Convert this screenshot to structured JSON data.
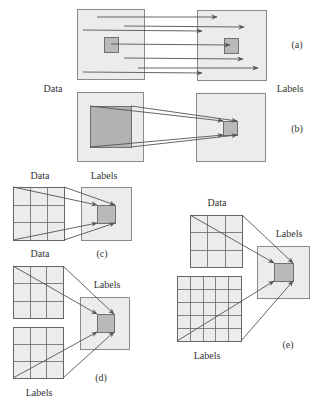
{
  "colors": {
    "box_fill": "#ececec",
    "box_stroke": "#8a8a8a",
    "target_fill": "#b9b9b9",
    "target_stroke": "#707070",
    "arrow": "#555555",
    "grid_line": "#666666",
    "text": "#333333"
  },
  "labels": [
    {
      "id": "a-caption",
      "text": "(a)",
      "x": 297,
      "y": 45
    },
    {
      "id": "ab-data",
      "text": "Data",
      "x": 53,
      "y": 89
    },
    {
      "id": "ab-labels",
      "text": "Labels",
      "x": 290,
      "y": 89
    },
    {
      "id": "b-caption",
      "text": "(b)",
      "x": 297,
      "y": 129
    },
    {
      "id": "c-data",
      "text": "Data",
      "x": 40,
      "y": 176
    },
    {
      "id": "c-labels",
      "text": "Labels",
      "x": 104,
      "y": 176
    },
    {
      "id": "c-caption",
      "text": "(c)",
      "x": 102,
      "y": 254
    },
    {
      "id": "d-data",
      "text": "Data",
      "x": 40,
      "y": 254
    },
    {
      "id": "d-labels-right",
      "text": "Labels",
      "x": 107,
      "y": 285
    },
    {
      "id": "d-caption",
      "text": "(d)",
      "x": 101,
      "y": 378
    },
    {
      "id": "d-labels-bottom",
      "text": "Labels",
      "x": 39,
      "y": 393
    },
    {
      "id": "e-data",
      "text": "Data",
      "x": 217,
      "y": 203
    },
    {
      "id": "e-labels-right",
      "text": "Labels",
      "x": 289,
      "y": 234
    },
    {
      "id": "e-caption",
      "text": "(e)",
      "x": 288,
      "y": 345
    },
    {
      "id": "e-labels-bottom",
      "text": "Labels",
      "x": 207,
      "y": 356
    }
  ],
  "panels": {
    "a": {
      "boxes": [
        {
          "x": 77,
          "y": 9,
          "w": 67,
          "h": 70
        },
        {
          "x": 197,
          "y": 10,
          "w": 69,
          "h": 70
        }
      ],
      "targets": [
        {
          "x": 104,
          "y": 37,
          "w": 14,
          "h": 15
        },
        {
          "x": 224,
          "y": 38,
          "w": 14,
          "h": 15
        }
      ],
      "arrows": [
        [
          97,
          17,
          217,
          17
        ],
        [
          124,
          26,
          244,
          27
        ],
        [
          83,
          30,
          202,
          31
        ],
        [
          111,
          44,
          230,
          45
        ],
        [
          124,
          58,
          243,
          59
        ],
        [
          138,
          68,
          258,
          68
        ],
        [
          83,
          72,
          202,
          73
        ]
      ]
    },
    "b": {
      "boxes": [
        {
          "x": 77,
          "y": 92,
          "w": 66,
          "h": 69
        },
        {
          "x": 196,
          "y": 93,
          "w": 69,
          "h": 68
        }
      ],
      "targets": [
        {
          "x": 90,
          "y": 106,
          "w": 41,
          "h": 41,
          "fill": "#b2b2b2"
        },
        {
          "x": 223,
          "y": 121,
          "w": 14,
          "h": 14
        }
      ],
      "arrows": [
        [
          90,
          106,
          223,
          121
        ],
        [
          131,
          106,
          237,
          121
        ],
        [
          90,
          147,
          223,
          135
        ],
        [
          131,
          147,
          237,
          135
        ]
      ]
    },
    "c": {
      "grids": [
        {
          "x": 13,
          "y": 187,
          "w": 51,
          "h": 53,
          "cols": 3,
          "rows": 3
        }
      ],
      "boxes": [
        {
          "x": 81,
          "y": 187,
          "w": 50,
          "h": 53
        }
      ],
      "targets": [
        {
          "x": 97,
          "y": 205,
          "w": 18,
          "h": 18
        }
      ],
      "arrows": [
        [
          13,
          187,
          97,
          205
        ],
        [
          64,
          187,
          115,
          205
        ],
        [
          13,
          240,
          97,
          223
        ],
        [
          64,
          240,
          115,
          223
        ]
      ]
    },
    "d": {
      "grids": [
        {
          "x": 13,
          "y": 266,
          "w": 50,
          "h": 52,
          "cols": 3,
          "rows": 3
        },
        {
          "x": 13,
          "y": 327,
          "w": 50,
          "h": 51,
          "cols": 3,
          "rows": 3
        }
      ],
      "boxes": [
        {
          "x": 80,
          "y": 297,
          "w": 49,
          "h": 52
        }
      ],
      "targets": [
        {
          "x": 97,
          "y": 314,
          "w": 17,
          "h": 18
        }
      ],
      "arrows": [
        [
          13,
          266,
          97,
          314
        ],
        [
          63,
          266,
          114,
          314
        ],
        [
          13,
          378,
          97,
          332
        ],
        [
          63,
          378,
          114,
          332
        ]
      ]
    },
    "e": {
      "grids": [
        {
          "x": 190,
          "y": 215,
          "w": 52,
          "h": 52,
          "cols": 3,
          "rows": 3
        },
        {
          "x": 177,
          "y": 276,
          "w": 64,
          "h": 65,
          "cols": 5,
          "rows": 5
        }
      ],
      "boxes": [
        {
          "x": 257,
          "y": 246,
          "w": 52,
          "h": 52
        }
      ],
      "targets": [
        {
          "x": 274,
          "y": 263,
          "w": 19,
          "h": 18
        }
      ],
      "arrows": [
        [
          190,
          215,
          274,
          263
        ],
        [
          242,
          215,
          293,
          263
        ],
        [
          177,
          341,
          274,
          281
        ],
        [
          241,
          341,
          293,
          281
        ]
      ]
    }
  }
}
